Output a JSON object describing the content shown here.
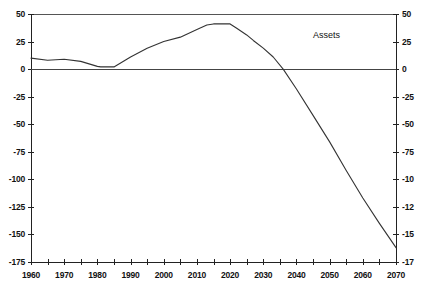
{
  "chart_data": {
    "type": "line",
    "title": "",
    "subtitle": "",
    "xlabel": "",
    "ylabel": "",
    "xlim": [
      1960,
      2070
    ],
    "ylim": [
      -175,
      50
    ],
    "grid": false,
    "legend_position": "inline-annotation",
    "y_ticks": [
      50,
      25,
      0,
      -25,
      -50,
      -75,
      -100,
      -125,
      -150,
      -175
    ],
    "y_tick_labels_left": [
      "50",
      "25",
      "0",
      "-25",
      "-50",
      "-75",
      "-100",
      "-125",
      "-150",
      "-175"
    ],
    "y_tick_labels_right": [
      "50",
      "25",
      "0",
      "-25",
      "-50",
      "-75",
      "-10",
      "-12",
      "-15",
      "-17"
    ],
    "x_ticks": [
      1960,
      1970,
      1980,
      1990,
      2000,
      2010,
      2020,
      2030,
      2040,
      2050,
      2060,
      2070
    ],
    "x_tick_labels": [
      "1960",
      "1970",
      "1980",
      "1990",
      "2000",
      "2010",
      "2020",
      "2030",
      "2040",
      "2050",
      "2060",
      "2070"
    ],
    "x_minor_ticks": [
      1965,
      1975,
      1985,
      1995,
      2005,
      2015,
      2025,
      2035,
      2045,
      2055,
      2065
    ],
    "zero_line": 0,
    "series": [
      {
        "name": "Assets",
        "annotation": "Assets",
        "annotation_x": 2045,
        "annotation_y": 30,
        "color": "#333333",
        "x": [
          1960,
          1965,
          1970,
          1975,
          1980,
          1981,
          1983,
          1985,
          1990,
          1995,
          2000,
          2005,
          2010,
          2013,
          2015,
          2017,
          2019,
          2020,
          2022,
          2025,
          2027,
          2030,
          2033,
          2036,
          2040,
          2045,
          2050,
          2055,
          2060,
          2065,
          2070
        ],
        "values": [
          10,
          8,
          9,
          7,
          2.5,
          2,
          2,
          2,
          11,
          19,
          25,
          29,
          36,
          40,
          41,
          41,
          41,
          41,
          37,
          31,
          26,
          19,
          11,
          0,
          -18,
          -42,
          -66,
          -92,
          -117,
          -140,
          -162
        ]
      }
    ]
  },
  "annotations": {
    "series_label": "Assets"
  }
}
